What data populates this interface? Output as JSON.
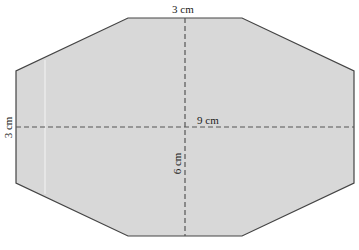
{
  "diagram": {
    "shape": "octagon",
    "fill_color": "#d8d8d8",
    "stroke_color": "#444444",
    "dash_color": "#555555",
    "vertices": [
      [
        128,
        18
      ],
      [
        242,
        18
      ],
      [
        354,
        71
      ],
      [
        354,
        183
      ],
      [
        242,
        236
      ],
      [
        128,
        236
      ],
      [
        16,
        183
      ],
      [
        16,
        71
      ]
    ],
    "horizontal_line": {
      "y": 127,
      "x1": 16,
      "x2": 354
    },
    "vertical_line": {
      "x": 185,
      "y1": 18,
      "y2": 236
    },
    "labels": {
      "top_edge": "3 cm",
      "left_edge": "3 cm",
      "horizontal_width": "9 cm",
      "vertical_height": "6 cm"
    }
  }
}
